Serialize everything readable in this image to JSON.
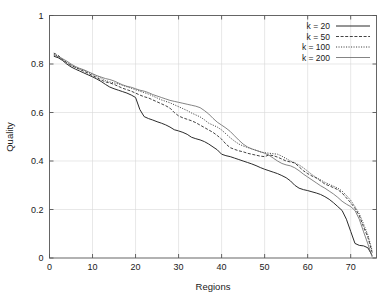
{
  "chart_data": {
    "type": "line",
    "title": "",
    "xlabel": "Regions",
    "ylabel": "Quality",
    "xlim": [
      0,
      76
    ],
    "ylim": [
      0,
      1
    ],
    "grid": true,
    "legend_position": "top-right",
    "xticks": [
      0,
      10,
      20,
      30,
      40,
      50,
      60,
      70
    ],
    "xtick_labels": [
      "0",
      "10",
      "20",
      "30",
      "40",
      "50",
      "60",
      "70"
    ],
    "yticks": [
      0,
      0.2,
      0.4,
      0.6,
      0.8,
      1
    ],
    "ytick_labels": [
      "0",
      "0.2",
      "0.4",
      "0.6",
      "0.8",
      "1"
    ],
    "series": [
      {
        "name": "k = 20",
        "style": "solid",
        "color": "#2b2b2b",
        "width": 1.0,
        "dash": "none",
        "x": [
          1,
          2,
          3,
          4,
          5,
          6,
          7,
          8,
          9,
          10,
          11,
          12,
          13,
          14,
          15,
          16,
          17,
          18,
          19,
          20,
          21,
          22,
          23,
          24,
          25,
          26,
          27,
          28,
          29,
          30,
          31,
          32,
          33,
          34,
          35,
          36,
          37,
          38,
          39,
          40,
          41,
          42,
          43,
          44,
          45,
          46,
          47,
          48,
          49,
          50,
          51,
          52,
          53,
          54,
          55,
          56,
          57,
          58,
          59,
          60,
          61,
          62,
          63,
          64,
          65,
          66,
          67,
          68,
          69,
          70,
          71,
          72,
          73,
          74,
          75
        ],
        "y": [
          0.832,
          0.826,
          0.815,
          0.8,
          0.788,
          0.779,
          0.771,
          0.763,
          0.755,
          0.747,
          0.738,
          0.728,
          0.716,
          0.705,
          0.698,
          0.692,
          0.686,
          0.68,
          0.672,
          0.662,
          0.612,
          0.583,
          0.575,
          0.569,
          0.562,
          0.556,
          0.549,
          0.54,
          0.529,
          0.524,
          0.518,
          0.51,
          0.498,
          0.492,
          0.487,
          0.48,
          0.47,
          0.458,
          0.446,
          0.428,
          0.422,
          0.418,
          0.412,
          0.406,
          0.4,
          0.394,
          0.388,
          0.381,
          0.373,
          0.366,
          0.36,
          0.354,
          0.348,
          0.34,
          0.331,
          0.318,
          0.3,
          0.288,
          0.282,
          0.278,
          0.273,
          0.268,
          0.262,
          0.253,
          0.242,
          0.228,
          0.212,
          0.196,
          0.16,
          0.11,
          0.06,
          0.052,
          0.05,
          0.042,
          0.01
        ]
      },
      {
        "name": "k = 50",
        "style": "dashed",
        "color": "#3a3a3a",
        "width": 0.95,
        "dash": "3,1.6",
        "x": [
          1,
          2,
          3,
          4,
          5,
          6,
          7,
          8,
          9,
          10,
          11,
          12,
          13,
          14,
          15,
          16,
          17,
          18,
          19,
          20,
          21,
          22,
          23,
          24,
          25,
          26,
          27,
          28,
          29,
          30,
          31,
          32,
          33,
          34,
          35,
          36,
          37,
          38,
          39,
          40,
          41,
          42,
          43,
          44,
          45,
          46,
          47,
          48,
          49,
          50,
          51,
          52,
          53,
          54,
          55,
          56,
          57,
          58,
          59,
          60,
          61,
          62,
          63,
          64,
          65,
          66,
          67,
          68,
          69,
          70,
          71,
          72,
          73,
          74,
          75
        ],
        "y": [
          0.845,
          0.836,
          0.82,
          0.806,
          0.795,
          0.786,
          0.778,
          0.77,
          0.762,
          0.752,
          0.744,
          0.734,
          0.726,
          0.722,
          0.716,
          0.708,
          0.7,
          0.694,
          0.688,
          0.68,
          0.672,
          0.665,
          0.66,
          0.652,
          0.644,
          0.636,
          0.628,
          0.618,
          0.6,
          0.586,
          0.578,
          0.572,
          0.566,
          0.558,
          0.548,
          0.538,
          0.528,
          0.518,
          0.505,
          0.49,
          0.47,
          0.455,
          0.448,
          0.442,
          0.438,
          0.432,
          0.428,
          0.424,
          0.42,
          0.418,
          0.425,
          0.422,
          0.416,
          0.408,
          0.4,
          0.396,
          0.392,
          0.376,
          0.36,
          0.348,
          0.338,
          0.33,
          0.318,
          0.305,
          0.298,
          0.29,
          0.282,
          0.268,
          0.248,
          0.228,
          0.205,
          0.175,
          0.128,
          0.085,
          0.022
        ]
      },
      {
        "name": "k = 100",
        "style": "dotted",
        "color": "#3a3a3a",
        "width": 0.95,
        "dash": "1.1,1.4",
        "x": [
          1,
          2,
          3,
          4,
          5,
          6,
          7,
          8,
          9,
          10,
          11,
          12,
          13,
          14,
          15,
          16,
          17,
          18,
          19,
          20,
          21,
          22,
          23,
          24,
          25,
          26,
          27,
          28,
          29,
          30,
          31,
          32,
          33,
          34,
          35,
          36,
          37,
          38,
          39,
          40,
          41,
          42,
          43,
          44,
          45,
          46,
          47,
          48,
          49,
          50,
          51,
          52,
          53,
          54,
          55,
          56,
          57,
          58,
          59,
          60,
          61,
          62,
          63,
          64,
          65,
          66,
          67,
          68,
          69,
          70,
          71,
          72,
          73,
          74,
          75
        ],
        "y": [
          0.84,
          0.832,
          0.818,
          0.804,
          0.794,
          0.786,
          0.78,
          0.774,
          0.766,
          0.758,
          0.75,
          0.742,
          0.732,
          0.726,
          0.722,
          0.718,
          0.712,
          0.706,
          0.7,
          0.694,
          0.688,
          0.682,
          0.676,
          0.668,
          0.66,
          0.652,
          0.646,
          0.64,
          0.632,
          0.624,
          0.616,
          0.608,
          0.598,
          0.59,
          0.582,
          0.57,
          0.556,
          0.548,
          0.54,
          0.528,
          0.512,
          0.496,
          0.482,
          0.47,
          0.462,
          0.456,
          0.45,
          0.444,
          0.438,
          0.434,
          0.432,
          0.43,
          0.428,
          0.42,
          0.41,
          0.4,
          0.392,
          0.384,
          0.372,
          0.358,
          0.344,
          0.332,
          0.322,
          0.312,
          0.304,
          0.296,
          0.288,
          0.276,
          0.258,
          0.238,
          0.212,
          0.182,
          0.14,
          0.095,
          0.03
        ]
      },
      {
        "name": "k = 200",
        "style": "solid-thin",
        "color": "#6e6e6e",
        "width": 0.85,
        "dash": "none",
        "x": [
          1,
          2,
          3,
          4,
          5,
          6,
          7,
          8,
          9,
          10,
          11,
          12,
          13,
          14,
          15,
          16,
          17,
          18,
          19,
          20,
          21,
          22,
          23,
          24,
          25,
          26,
          27,
          28,
          29,
          30,
          31,
          32,
          33,
          34,
          35,
          36,
          37,
          38,
          39,
          40,
          41,
          42,
          43,
          44,
          45,
          46,
          47,
          48,
          49,
          50,
          51,
          52,
          53,
          54,
          55,
          56,
          57,
          58,
          59,
          60,
          61,
          62,
          63,
          64,
          65,
          66,
          67,
          68,
          69,
          70,
          71,
          72,
          73,
          74,
          75
        ],
        "y": [
          0.836,
          0.83,
          0.822,
          0.812,
          0.8,
          0.79,
          0.782,
          0.776,
          0.768,
          0.76,
          0.752,
          0.746,
          0.74,
          0.736,
          0.73,
          0.722,
          0.714,
          0.708,
          0.704,
          0.698,
          0.692,
          0.688,
          0.682,
          0.674,
          0.668,
          0.662,
          0.656,
          0.65,
          0.646,
          0.642,
          0.638,
          0.634,
          0.63,
          0.626,
          0.62,
          0.608,
          0.594,
          0.576,
          0.56,
          0.548,
          0.536,
          0.522,
          0.504,
          0.486,
          0.47,
          0.458,
          0.45,
          0.444,
          0.438,
          0.432,
          0.424,
          0.412,
          0.4,
          0.39,
          0.384,
          0.38,
          0.372,
          0.36,
          0.346,
          0.334,
          0.322,
          0.31,
          0.298,
          0.288,
          0.276,
          0.264,
          0.25,
          0.234,
          0.222,
          0.212,
          0.196,
          0.16,
          0.108,
          0.058,
          0.004
        ]
      }
    ]
  },
  "legend": {
    "entries": [
      {
        "label": "k = 20"
      },
      {
        "label": "k = 50"
      },
      {
        "label": "k = 100"
      },
      {
        "label": "k = 200"
      }
    ]
  }
}
